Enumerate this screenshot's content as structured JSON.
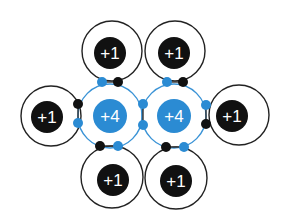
{
  "diagram": {
    "colors": {
      "carbon": "#2b8bd3",
      "hydrogen": "#111111",
      "shell_carbon": "#3a93d6",
      "shell_hydrogen": "#222222",
      "label": "#ffffff"
    },
    "carbons": [
      {
        "id": "carbon-left",
        "label": "+4",
        "cx": 110,
        "cy": 116,
        "shell_r": 32,
        "nucleus_r": 17
      },
      {
        "id": "carbon-right",
        "label": "+4",
        "cx": 174,
        "cy": 116,
        "shell_r": 32,
        "nucleus_r": 17
      }
    ],
    "hydrogens": [
      {
        "id": "hydrogen-top-left",
        "label": "+1",
        "cx": 112,
        "cy": 51,
        "shell_r": 30,
        "ncx": 110,
        "ncy": 53,
        "nucleus_r": 16
      },
      {
        "id": "hydrogen-top-right",
        "label": "+1",
        "cx": 175,
        "cy": 51,
        "shell_r": 30,
        "ncx": 174,
        "ncy": 53,
        "nucleus_r": 16
      },
      {
        "id": "hydrogen-left",
        "label": "+1",
        "cx": 51,
        "cy": 116,
        "shell_r": 30,
        "ncx": 47,
        "ncy": 117,
        "nucleus_r": 16
      },
      {
        "id": "hydrogen-right",
        "label": "+1",
        "cx": 239,
        "cy": 115,
        "shell_r": 30,
        "ncx": 232,
        "ncy": 116,
        "nucleus_r": 16
      },
      {
        "id": "hydrogen-bottom-left",
        "label": "+1",
        "cx": 112,
        "cy": 177,
        "shell_r": 31,
        "ncx": 113,
        "ncy": 180,
        "nucleus_r": 16
      },
      {
        "id": "hydrogen-bottom-right",
        "label": "+1",
        "cx": 176,
        "cy": 178,
        "shell_r": 31,
        "ncx": 176,
        "ncy": 181,
        "nucleus_r": 16
      }
    ],
    "electrons": [
      {
        "type": "carbon",
        "cx": 102,
        "cy": 82
      },
      {
        "type": "hydrogen",
        "cx": 118,
        "cy": 82
      },
      {
        "type": "carbon",
        "cx": 167,
        "cy": 82
      },
      {
        "type": "hydrogen",
        "cx": 183,
        "cy": 82
      },
      {
        "type": "hydrogen",
        "cx": 78,
        "cy": 104
      },
      {
        "type": "carbon",
        "cx": 78,
        "cy": 123
      },
      {
        "type": "carbon",
        "cx": 143,
        "cy": 104
      },
      {
        "type": "carbon",
        "cx": 143,
        "cy": 125
      },
      {
        "type": "carbon",
        "cx": 206,
        "cy": 105
      },
      {
        "type": "hydrogen",
        "cx": 206,
        "cy": 124
      },
      {
        "type": "hydrogen",
        "cx": 100,
        "cy": 146
      },
      {
        "type": "carbon",
        "cx": 118,
        "cy": 146
      },
      {
        "type": "hydrogen",
        "cx": 166,
        "cy": 147
      },
      {
        "type": "carbon",
        "cx": 184,
        "cy": 147
      }
    ],
    "bond_lines": [
      {
        "x1": 102,
        "y1": 82,
        "x2": 118,
        "y2": 82
      },
      {
        "x1": 167,
        "y1": 82,
        "x2": 183,
        "y2": 82
      },
      {
        "x1": 78,
        "y1": 104,
        "x2": 78,
        "y2": 123
      },
      {
        "x1": 143,
        "y1": 104,
        "x2": 143,
        "y2": 125
      },
      {
        "x1": 206,
        "y1": 105,
        "x2": 206,
        "y2": 124
      },
      {
        "x1": 100,
        "y1": 146,
        "x2": 118,
        "y2": 146
      },
      {
        "x1": 166,
        "y1": 147,
        "x2": 184,
        "y2": 147
      }
    ]
  }
}
